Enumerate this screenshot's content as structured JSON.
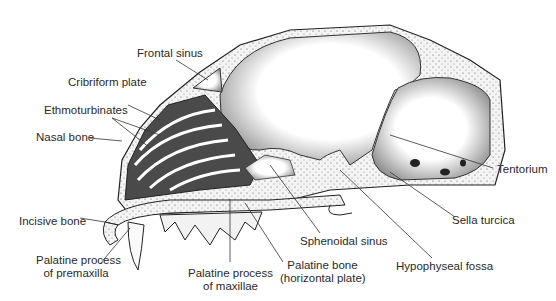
{
  "figure": {
    "labels": {
      "frontal_sinus": "Frontal sinus",
      "cribriform_plate": "Cribriform plate",
      "ethmoturbinates": "Ethmoturbinates",
      "nasal_bone": "Nasal bone",
      "incisive_bone": "Incisive bone",
      "palatine_process_premaxilla_1": "Palatine process",
      "palatine_process_premaxilla_2": "of premaxilla",
      "palatine_process_maxillae_1": "Palatine process",
      "palatine_process_maxillae_2": "of maxillae",
      "palatine_bone_1": "Palatine bone",
      "palatine_bone_2": "(horizontal plate)",
      "sphenoidal_sinus": "Sphenoidal sinus",
      "hypophyseal_fossa": "Hypophyseal fossa",
      "sella_turcica": "Sella turcica",
      "tentorium": "Tentorium"
    }
  }
}
